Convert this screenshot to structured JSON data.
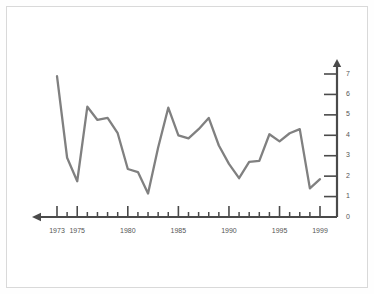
{
  "chart_data": {
    "type": "line",
    "title": "",
    "subtitle": "",
    "xlabel": "",
    "ylabel": "",
    "x": [
      1973,
      1974,
      1975,
      1976,
      1977,
      1978,
      1979,
      1980,
      1981,
      1982,
      1983,
      1984,
      1985,
      1986,
      1987,
      1988,
      1989,
      1990,
      1991,
      1992,
      1993,
      1994,
      1995,
      1996,
      1997,
      1998,
      1999
    ],
    "values": [
      6.9,
      2.9,
      1.75,
      5.4,
      4.75,
      4.85,
      4.1,
      2.35,
      2.2,
      1.15,
      3.4,
      5.35,
      4.0,
      3.85,
      4.3,
      4.85,
      3.5,
      2.6,
      1.9,
      2.7,
      2.75,
      4.05,
      3.7,
      4.1,
      4.3,
      1.4,
      1.85
    ],
    "series": [
      {
        "name": "series-1",
        "color": "#808080",
        "values": [
          6.9,
          2.9,
          1.75,
          5.4,
          4.75,
          4.85,
          4.1,
          2.35,
          2.2,
          1.15,
          3.4,
          5.35,
          4.0,
          3.85,
          4.3,
          4.85,
          3.5,
          2.6,
          1.9,
          2.7,
          2.75,
          4.05,
          3.7,
          4.1,
          4.3,
          1.4,
          1.85
        ]
      }
    ],
    "xlim": [
      1973,
      1999
    ],
    "ylim": [
      0,
      7
    ],
    "grid": false,
    "legend": "none",
    "y_axis_position": "right",
    "x_axis_arrow": "left",
    "y_axis_arrow": "up",
    "y_ticks": [
      0,
      1,
      2,
      3,
      4,
      5,
      6,
      7
    ],
    "y_tick_labels": [
      "0",
      "1",
      "2",
      "3",
      "4",
      "5",
      "6",
      "7"
    ],
    "x_tick_labels": [
      "1973",
      "1975",
      "1980",
      "1985",
      "1990",
      "1995",
      "1999"
    ],
    "x_major_ticks": [
      1973,
      1975,
      1980,
      1985,
      1990,
      1995,
      1999
    ],
    "x_minor_ticks": [
      1974,
      1976,
      1977,
      1978,
      1979,
      1981,
      1982,
      1983,
      1984,
      1986,
      1987,
      1988,
      1989,
      1991,
      1992,
      1993,
      1994,
      1996,
      1997,
      1998
    ],
    "annotations": []
  },
  "colors": {
    "line": "#808080",
    "axis": "#4a4a4a",
    "tick_text": "#555555",
    "panel_border": "#d9d9d9",
    "panel_background": "#ffffff"
  }
}
